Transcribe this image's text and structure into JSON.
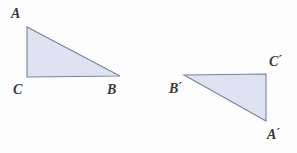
{
  "figure": {
    "background_color": "#fdfdfd",
    "fill_color": "#dde3f0",
    "stroke_color": "#7b8398",
    "label_color": "#3a3a3c",
    "canvas": {
      "width": 297,
      "height": 153
    }
  },
  "shapes": [
    {
      "name": "triangle-abc",
      "label": "Triangle ABC",
      "points": "27,27 27,77 120,76",
      "vertices": [
        {
          "id": "A",
          "letter": "A",
          "prime": "",
          "x": 27,
          "y": 27
        },
        {
          "id": "C",
          "letter": "C",
          "prime": "",
          "x": 27,
          "y": 77
        },
        {
          "id": "B",
          "letter": "B",
          "prime": "",
          "x": 120,
          "y": 76
        }
      ],
      "right_angle_at": "C"
    },
    {
      "name": "triangle-a-prime-b-prime-c-prime",
      "label": "Triangle A'B'C'",
      "points": "184,75 266,74 266,121",
      "vertices": [
        {
          "id": "Bp",
          "letter": "B",
          "prime": "´",
          "x": 184,
          "y": 75
        },
        {
          "id": "Cp",
          "letter": "C",
          "prime": "´",
          "x": 266,
          "y": 74
        },
        {
          "id": "Ap",
          "letter": "A",
          "prime": "´",
          "x": 266,
          "y": 121
        }
      ],
      "right_angle_at": "C'"
    }
  ],
  "labels": {
    "A": {
      "letter": "A",
      "prime": ""
    },
    "C": {
      "letter": "C",
      "prime": ""
    },
    "B": {
      "letter": "B",
      "prime": ""
    },
    "Bp": {
      "letter": "B",
      "prime": "´"
    },
    "Cp": {
      "letter": "C",
      "prime": "´"
    },
    "Ap": {
      "letter": "A",
      "prime": "´"
    }
  }
}
